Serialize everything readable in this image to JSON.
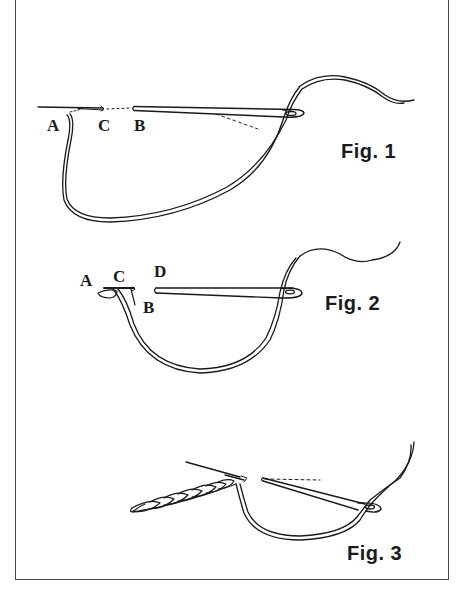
{
  "figures": [
    {
      "id": "fig1",
      "caption": "Fig. 1",
      "points": {
        "A": "A",
        "C": "C",
        "B": "B"
      }
    },
    {
      "id": "fig2",
      "caption": "Fig. 2",
      "points": {
        "A": "A",
        "C": "C",
        "D": "D",
        "B": "B"
      }
    },
    {
      "id": "fig3",
      "caption": "Fig. 3",
      "points": {}
    }
  ],
  "colors": {
    "ink": "#1a1a1a",
    "frame": "#4a4a4a",
    "background": "#ffffff"
  }
}
